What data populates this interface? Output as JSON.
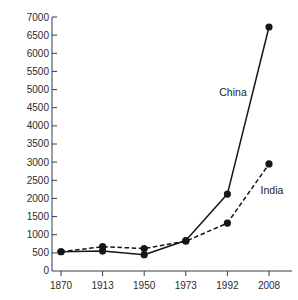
{
  "chart_data": {
    "type": "line",
    "title": "",
    "subtitle": "",
    "xlabel": "",
    "ylabel": "",
    "categories": [
      "1870",
      "1913",
      "1950",
      "1973",
      "1992",
      "2008"
    ],
    "x_tick_labels": [
      "1870",
      "1913",
      "1950",
      "1973",
      "1992",
      "2008"
    ],
    "y_tick_labels": [
      "0",
      "500",
      "1000",
      "1500",
      "2000",
      "2500",
      "3000",
      "3500",
      "4000",
      "4500",
      "5000",
      "5500",
      "6000",
      "6500",
      "7000"
    ],
    "ylim": [
      0,
      7000
    ],
    "y_tick_step": 500,
    "grid": false,
    "legend_position": "inline-annotation",
    "series": [
      {
        "name": "China",
        "style": "solid",
        "marker": "filled-circle",
        "color": "#161616",
        "values": [
          530,
          550,
          450,
          840,
          2120,
          6725
        ]
      },
      {
        "name": "India",
        "style": "dashed",
        "marker": "filled-circle",
        "color": "#161616",
        "values": [
          530,
          670,
          620,
          820,
          1320,
          2950
        ]
      }
    ],
    "annotations": [
      {
        "text": "China",
        "series": "China",
        "x_px": 233,
        "y_px": 96
      },
      {
        "text": "India",
        "series": "India",
        "x_px": 272,
        "y_px": 194
      }
    ]
  },
  "colors": {
    "background": "#ffffff",
    "axis": "#3a3a3a",
    "ink": "#161616",
    "tick_text": "#2b2b2b"
  }
}
